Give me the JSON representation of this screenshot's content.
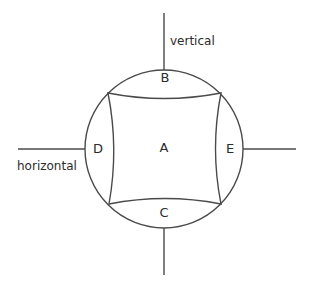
{
  "diagram": {
    "background_color": "#ffffff",
    "stroke_color": "#4a4a4a",
    "text_color": "#2b2b2b",
    "circle": {
      "center_x": 164,
      "center_y": 149,
      "radius": 79
    },
    "axes": [
      {
        "id": "vertical",
        "label": "vertical",
        "orientation": "vertical",
        "label_x": 170,
        "label_y": 44,
        "line_top_y": 13,
        "line_bottom_y": 275
      },
      {
        "id": "horizontal",
        "label": "horizontal",
        "orientation": "horizontal",
        "label_x": 17,
        "label_y": 170,
        "line_left_x": 18,
        "line_right_x": 296
      }
    ],
    "regions": [
      {
        "id": "region-a",
        "label": "A",
        "x": 164,
        "y": 148,
        "description": "central curved square"
      },
      {
        "id": "region-b",
        "label": "B",
        "x": 165,
        "y": 78,
        "description": "top lune"
      },
      {
        "id": "region-c",
        "label": "C",
        "x": 164,
        "y": 213,
        "description": "bottom lune"
      },
      {
        "id": "region-d",
        "label": "D",
        "x": 98,
        "y": 149,
        "description": "left lune"
      },
      {
        "id": "region-e",
        "label": "E",
        "x": 230,
        "y": 149,
        "description": "right lune"
      }
    ],
    "inner_shape": {
      "description": "curved square with concave sides joining four points on the circle",
      "corners": [
        {
          "id": "top-left",
          "x": 108,
          "y": 93
        },
        {
          "id": "top-right",
          "x": 221,
          "y": 93
        },
        {
          "id": "bottom-right",
          "x": 221,
          "y": 204
        },
        {
          "id": "bottom-left",
          "x": 109,
          "y": 204
        }
      ],
      "path": "M 108 93 Q 164 104 221 93 Q 210 148.5 221 204 Q 165 193 109 204 Q 119 148.5 108 93 Z"
    }
  }
}
